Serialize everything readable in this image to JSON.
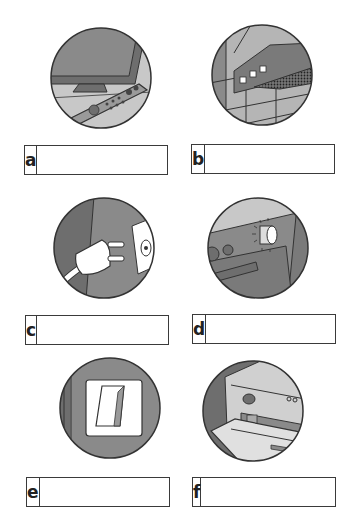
{
  "exercise": {
    "items": [
      {
        "letter": "a",
        "picture": "tv-remote-control",
        "answer": "",
        "placeholder": ""
      },
      {
        "letter": "b",
        "picture": "extractor-fan-hood",
        "answer": "",
        "placeholder": ""
      },
      {
        "letter": "c",
        "picture": "plug-and-socket",
        "answer": "",
        "placeholder": ""
      },
      {
        "letter": "d",
        "picture": "oven-dial-knob",
        "answer": "",
        "placeholder": ""
      },
      {
        "letter": "e",
        "picture": "light-switch",
        "answer": "",
        "placeholder": ""
      },
      {
        "letter": "f",
        "picture": "dishwasher-door",
        "answer": "",
        "placeholder": ""
      }
    ]
  },
  "colors": {
    "outline": "#3a3a3a",
    "dark_gray": "#6e6e6e",
    "mid_gray": "#8a8a8a",
    "light_gray": "#c8c8c8",
    "white": "#ffffff"
  }
}
